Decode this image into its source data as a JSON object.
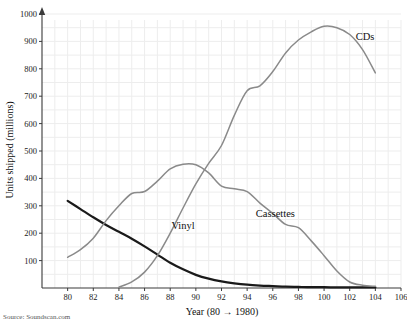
{
  "chart_data": {
    "type": "line",
    "title": "",
    "subtitle": "",
    "xlabel": "Year (80 → 1980)",
    "ylabel": "Units shipped (millions)",
    "xlim": [
      78,
      106
    ],
    "ylim": [
      0,
      1000
    ],
    "grid": true,
    "legend_position": "inline-annotations",
    "x_ticks": [
      80,
      82,
      84,
      86,
      88,
      90,
      92,
      94,
      96,
      98,
      100,
      102,
      104,
      106
    ],
    "x_tick_labels": [
      "80",
      "82",
      "84",
      "86",
      "88",
      "90",
      "92",
      "94",
      "96",
      "98",
      "100",
      "102",
      "104",
      "106"
    ],
    "y_ticks": [
      100,
      200,
      300,
      400,
      500,
      600,
      700,
      800,
      900,
      1000
    ],
    "y_tick_labels": [
      "100",
      "200",
      "300",
      "400",
      "500",
      "600",
      "700",
      "800",
      "900",
      "1000"
    ],
    "series": [
      {
        "name": "Vinyl",
        "color": "#1a1a1a",
        "width": 2.2,
        "label_x": 89,
        "label_y": 215,
        "x": [
          80,
          81,
          82,
          83,
          84,
          85,
          86,
          87,
          88,
          89,
          90,
          91,
          92,
          93,
          94,
          95,
          96,
          97,
          98,
          99,
          100,
          101,
          102,
          103,
          104
        ],
        "values": [
          318,
          288,
          258,
          230,
          205,
          180,
          152,
          122,
          92,
          68,
          48,
          34,
          24,
          17,
          12,
          9,
          7,
          5,
          4,
          3,
          3,
          2,
          2,
          2,
          2
        ]
      },
      {
        "name": "Cassettes",
        "color": "#8a8a8a",
        "width": 1.5,
        "label_x": 96.2,
        "label_y": 258,
        "x": [
          80,
          81,
          82,
          83,
          84,
          85,
          86,
          87,
          88,
          89,
          90,
          91,
          92,
          93,
          94,
          95,
          96,
          97,
          98,
          99,
          100,
          101,
          102,
          103,
          104
        ],
        "values": [
          112,
          140,
          182,
          246,
          300,
          345,
          352,
          390,
          435,
          452,
          450,
          420,
          372,
          362,
          352,
          310,
          272,
          232,
          220,
          172,
          118,
          62,
          22,
          10,
          6
        ]
      },
      {
        "name": "CDs",
        "color": "#8a8a8a",
        "width": 1.5,
        "label_x": 103.2,
        "label_y": 905,
        "x": [
          84,
          85,
          86,
          87,
          88,
          89,
          90,
          91,
          92,
          93,
          94,
          95,
          96,
          97,
          98,
          99,
          100,
          101,
          102,
          103,
          104
        ],
        "values": [
          3,
          22,
          58,
          118,
          200,
          292,
          380,
          455,
          520,
          630,
          720,
          738,
          790,
          858,
          905,
          935,
          955,
          950,
          925,
          870,
          785
        ]
      }
    ],
    "source_note": "Source: Soundscan.com"
  }
}
